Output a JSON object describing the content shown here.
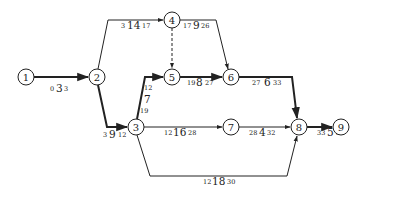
{
  "diagram": {
    "type": "activity-on-arrow network (CPM)",
    "nodes": [
      {
        "id": "1",
        "x": 26,
        "y": 77
      },
      {
        "id": "2",
        "x": 97,
        "y": 77
      },
      {
        "id": "3",
        "x": 136,
        "y": 127
      },
      {
        "id": "4",
        "x": 172,
        "y": 20
      },
      {
        "id": "5",
        "x": 172,
        "y": 77
      },
      {
        "id": "6",
        "x": 231,
        "y": 77
      },
      {
        "id": "7",
        "x": 231,
        "y": 127
      },
      {
        "id": "8",
        "x": 299,
        "y": 127
      },
      {
        "id": "9",
        "x": 341,
        "y": 127
      }
    ],
    "edges": [
      {
        "from": "1",
        "to": "2",
        "start": "0",
        "duration": "3",
        "finish": "3",
        "critical": true,
        "dummy": false
      },
      {
        "from": "2",
        "to": "4",
        "start": "3",
        "duration": "14",
        "finish": "17",
        "critical": false,
        "dummy": false
      },
      {
        "from": "2",
        "to": "3",
        "start": "3",
        "duration": "9",
        "finish": "12",
        "critical": true,
        "dummy": false
      },
      {
        "from": "4",
        "to": "5",
        "start": "",
        "duration": "",
        "finish": "",
        "critical": false,
        "dummy": true
      },
      {
        "from": "4",
        "to": "6",
        "start": "17",
        "duration": "9",
        "finish": "26",
        "critical": false,
        "dummy": false
      },
      {
        "from": "3",
        "to": "5",
        "start": "12",
        "duration": "7",
        "finish": "19",
        "critical": true,
        "dummy": false
      },
      {
        "from": "5",
        "to": "6",
        "start": "19",
        "duration": "8",
        "finish": "27",
        "critical": true,
        "dummy": false
      },
      {
        "from": "6",
        "to": "8",
        "start": "27",
        "duration": "6",
        "finish": "33",
        "critical": true,
        "dummy": false
      },
      {
        "from": "3",
        "to": "7",
        "start": "12",
        "duration": "16",
        "finish": "28",
        "critical": false,
        "dummy": false
      },
      {
        "from": "7",
        "to": "8",
        "start": "28",
        "duration": "4",
        "finish": "32",
        "critical": false,
        "dummy": false
      },
      {
        "from": "3",
        "to": "8",
        "start": "12",
        "duration": "18",
        "finish": "30",
        "critical": false,
        "dummy": false
      },
      {
        "from": "8",
        "to": "9",
        "start": "33",
        "duration": "5",
        "finish": "38",
        "critical": true,
        "dummy": false
      }
    ]
  },
  "colors": {
    "line": "#222222",
    "background": "#ffffff"
  }
}
